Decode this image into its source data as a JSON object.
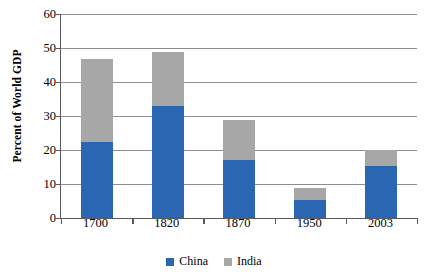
{
  "chart_data": {
    "type": "bar",
    "stacked": true,
    "title": "",
    "xlabel": "",
    "ylabel": "Percent of World GDP",
    "categories": [
      "1700",
      "1820",
      "1870",
      "1950",
      "2003"
    ],
    "series": [
      {
        "name": "China",
        "color": "#2b66b2",
        "values": [
          22.5,
          33.0,
          17.1,
          5.2,
          15.2
        ]
      },
      {
        "name": "India",
        "color": "#a7a7a7",
        "values": [
          24.2,
          15.8,
          11.7,
          3.6,
          4.8
        ]
      }
    ],
    "totals": [
      46.7,
      48.8,
      28.8,
      8.8,
      20.0
    ],
    "ylim": [
      0,
      60
    ],
    "yticks": [
      0,
      10,
      20,
      30,
      40,
      50,
      60
    ],
    "ytick_labels": [
      "0",
      "10",
      "20",
      "30",
      "40",
      "50",
      "60"
    ],
    "grid": true,
    "grid_axis": "y",
    "legend_position": "bottom-center",
    "legend_entries": [
      {
        "label": "China",
        "color": "#2b66b2"
      },
      {
        "label": "India",
        "color": "#a7a7a7"
      }
    ]
  },
  "axis": {
    "y_title": "Percent of World GDP"
  }
}
